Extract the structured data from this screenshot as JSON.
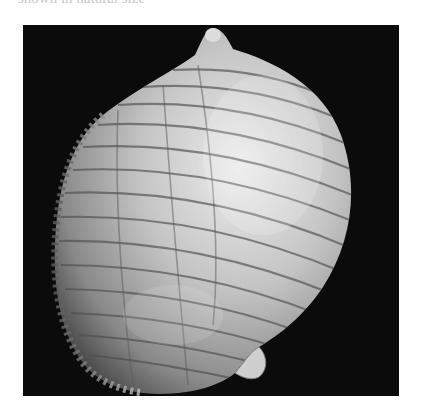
{
  "page": {
    "background": "#ffffff",
    "caption_fragment": {
      "visible": "truncated",
      "note_text": "shown in natural size",
      "color": "#c8c8c8"
    }
  },
  "figure": {
    "type": "photograph",
    "background_color": "#0b0b0b",
    "box": {
      "x": 23,
      "y": 25,
      "width": 376,
      "height": 371
    },
    "shell_tone_light": "#e6e6e6",
    "shell_tone_mid": "#9a9a9a",
    "shell_tone_dark": "#4a4a4a"
  }
}
